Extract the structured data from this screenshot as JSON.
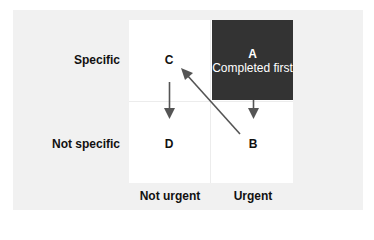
{
  "diagram": {
    "type": "2x2 priority matrix",
    "row_labels": [
      "Specific",
      "Not specific"
    ],
    "column_labels": [
      "Not urgent",
      "Urgent"
    ],
    "quadrants": {
      "A": {
        "letter": "A",
        "caption": "Completed first",
        "row": "Specific",
        "column": "Urgent",
        "highlighted": true
      },
      "B": {
        "letter": "B",
        "row": "Not specific",
        "column": "Urgent"
      },
      "C": {
        "letter": "C",
        "row": "Specific",
        "column": "Not urgent"
      },
      "D": {
        "letter": "D",
        "row": "Not specific",
        "column": "Not urgent"
      }
    },
    "arrows": [
      {
        "from": "A",
        "to": "B",
        "direction": "down"
      },
      {
        "from": "C",
        "to": "D",
        "direction": "down"
      },
      {
        "from": "B",
        "to": "C",
        "direction": "diagonal-up-left"
      }
    ],
    "colors": {
      "highlight_box": "#333333",
      "highlight_text": "#ffffff",
      "panel_background": "#f1f1f1",
      "grid_background": "#ffffff",
      "arrow": "#555555",
      "text": "#111111"
    }
  }
}
